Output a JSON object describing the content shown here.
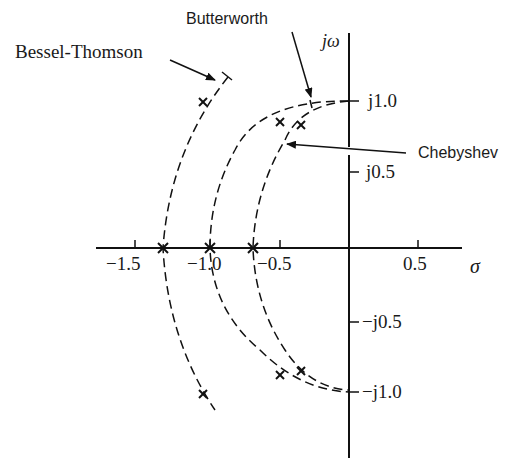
{
  "figure": {
    "axes": {
      "horizontal_label": "σ",
      "vertical_label": "jω",
      "horizontal_ticks": [
        {
          "value": -1.5,
          "label": "−1.5"
        },
        {
          "value": -1.0,
          "label": "−1.0"
        },
        {
          "value": -0.5,
          "label": "−0.5"
        },
        {
          "value": 0.5,
          "label": "0.5"
        }
      ],
      "vertical_ticks": [
        {
          "value": 1.0,
          "label": "j1.0"
        },
        {
          "value": 0.5,
          "label": "j0.5"
        },
        {
          "value": -0.5,
          "label": "−j0.5"
        },
        {
          "value": -1.0,
          "label": "−j1.0"
        }
      ]
    },
    "curves": [
      {
        "name": "Bessel-Thomson",
        "label": "Bessel-Thomson",
        "style": "dashed",
        "poles": [
          {
            "re": -1.32,
            "im": 0
          },
          {
            "re": -1.05,
            "im": 1.0
          },
          {
            "re": -1.05,
            "im": -1.0
          }
        ]
      },
      {
        "name": "Butterworth",
        "label": "Butterworth",
        "style": "dashed",
        "poles": [
          {
            "re": -1.0,
            "im": 0
          },
          {
            "re": -0.5,
            "im": 0.87
          },
          {
            "re": -0.5,
            "im": -0.87
          }
        ]
      },
      {
        "name": "Chebyshev",
        "label": "Chebyshev",
        "style": "dashed",
        "poles": [
          {
            "re": -0.69,
            "im": 0
          },
          {
            "re": -0.35,
            "im": 0.85
          },
          {
            "re": -0.35,
            "im": -0.85
          }
        ]
      }
    ]
  },
  "labels": {
    "bessel": "Bessel-Thomson",
    "butterworth": "Butterworth",
    "chebyshev": "Chebyshev",
    "jw": "jω",
    "sigma": "σ",
    "tick_m15": "−1.5",
    "tick_m10": "−1.0",
    "tick_m05": "−0.5",
    "tick_p05": "0.5",
    "tick_j10": "j1.0",
    "tick_j05": "j0.5",
    "tick_mj05": "−j0.5",
    "tick_mj10": "−j1.0"
  }
}
